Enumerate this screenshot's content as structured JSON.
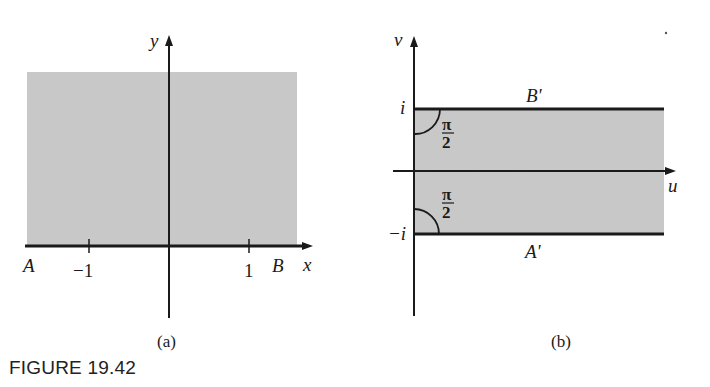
{
  "figure": {
    "caption": "FIGURE 19.42",
    "panel_a": {
      "label": "(a)",
      "x_axis_label": "x",
      "y_axis_label": "y",
      "tick_labels": [
        "−1",
        "1"
      ],
      "point_labels": [
        "A",
        "B"
      ],
      "region": "upper half-plane (shaded)"
    },
    "panel_b": {
      "label": "(b)",
      "u_axis_label": "u",
      "v_axis_label": "v",
      "tick_labels": [
        "i",
        "−i"
      ],
      "boundary_labels": [
        "B'",
        "A'"
      ],
      "angle_labels": [
        "π/2",
        "π/2"
      ],
      "region": "half-strip −1 < v < 1, u > 0 (shaded)"
    },
    "colors": {
      "shade": "#c8c8c8",
      "ink": "#1a1a1a"
    }
  }
}
